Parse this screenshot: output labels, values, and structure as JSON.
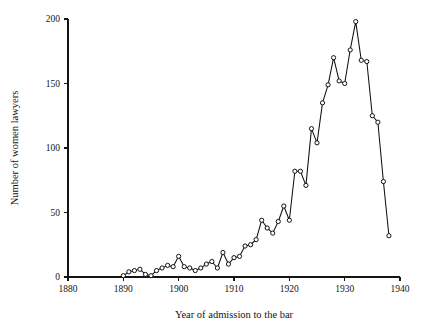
{
  "chart_data": {
    "type": "line",
    "title": "",
    "subtitle": "",
    "xlabel": "Year of admission to the bar",
    "ylabel": "Number of women lawyers",
    "xlim": [
      1880,
      1940
    ],
    "ylim": [
      0,
      200
    ],
    "xticks": [
      1880,
      1890,
      1900,
      1910,
      1920,
      1930,
      1940
    ],
    "xtick_labels": [
      "1880",
      "1890",
      "1900",
      "1910",
      "1920",
      "1930",
      "1940"
    ],
    "yticks": [
      0,
      50,
      100,
      150,
      200
    ],
    "ytick_labels": [
      "0",
      "50",
      "100",
      "150",
      "200"
    ],
    "grid": false,
    "legend": false,
    "legend_position": "none",
    "marker": "open-circle",
    "line_color": "#111111",
    "marker_face_color": "#ffffff",
    "marker_edge_color": "#111111",
    "series": [
      {
        "name": "Women admitted to the bar",
        "x": [
          1890,
          1891,
          1892,
          1893,
          1894,
          1895,
          1896,
          1897,
          1898,
          1899,
          1900,
          1901,
          1902,
          1903,
          1904,
          1905,
          1906,
          1907,
          1908,
          1909,
          1910,
          1911,
          1912,
          1913,
          1914,
          1915,
          1916,
          1917,
          1918,
          1919,
          1920,
          1921,
          1922,
          1923,
          1924,
          1925,
          1926,
          1927,
          1928,
          1929,
          1930,
          1931,
          1932,
          1933,
          1934,
          1935,
          1936,
          1937,
          1938
        ],
        "y": [
          1,
          4,
          5,
          6,
          2,
          1,
          5,
          7,
          9,
          8,
          16,
          8,
          7,
          5,
          7,
          10,
          12,
          7,
          19,
          10,
          15,
          16,
          24,
          25,
          29,
          44,
          38,
          34,
          43,
          55,
          44,
          82,
          82,
          71,
          115,
          104,
          135,
          149,
          170,
          152,
          150,
          176,
          198,
          168,
          167,
          125,
          120,
          74,
          32
        ]
      }
    ],
    "point_count": 49,
    "peak": {
      "x": 1932,
      "y": 198
    },
    "last": {
      "x": 1938,
      "y": 32
    }
  },
  "figure": {
    "background_color": "#ffffff",
    "axis_color": "#141414",
    "width": 424,
    "height": 335
  }
}
